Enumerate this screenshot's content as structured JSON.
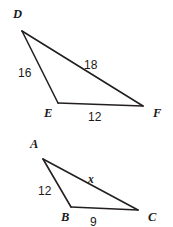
{
  "figure": {
    "background_color": "#ffffff",
    "stroke_color": "#231f20",
    "text_color": "#1a1a1a",
    "width": 173,
    "height": 227
  },
  "triangles": [
    {
      "id": "triangle-def",
      "name": "DEF",
      "vertices": [
        {
          "label": "D",
          "x": 22,
          "y": 31,
          "label_x": 13,
          "label_y": 18
        },
        {
          "label": "E",
          "x": 58,
          "y": 103,
          "label_x": 44,
          "label_y": 117
        },
        {
          "label": "F",
          "x": 143,
          "y": 106,
          "label_x": 153,
          "label_y": 117
        }
      ],
      "sides": [
        {
          "from": "D",
          "to": "E",
          "length": "16",
          "label_x": 18,
          "label_y": 77,
          "style": "number"
        },
        {
          "from": "D",
          "to": "F",
          "length": "18",
          "label_x": 84,
          "label_y": 69,
          "style": "number"
        },
        {
          "from": "E",
          "to": "F",
          "length": "12",
          "label_x": 88,
          "label_y": 121,
          "style": "number"
        }
      ]
    },
    {
      "id": "triangle-abc",
      "name": "ABC",
      "vertices": [
        {
          "label": "A",
          "x": 43,
          "y": 159,
          "label_x": 30,
          "label_y": 148
        },
        {
          "label": "B",
          "x": 71,
          "y": 207,
          "label_x": 61,
          "label_y": 221
        },
        {
          "label": "C",
          "x": 138,
          "y": 210,
          "label_x": 148,
          "label_y": 221
        }
      ],
      "sides": [
        {
          "from": "A",
          "to": "B",
          "length": "12",
          "label_x": 38,
          "label_y": 195,
          "style": "number"
        },
        {
          "from": "A",
          "to": "C",
          "length": "x",
          "label_x": 88,
          "label_y": 183,
          "style": "variable"
        },
        {
          "from": "B",
          "to": "C",
          "length": "9",
          "label_x": 90,
          "label_y": 226,
          "style": "number"
        }
      ]
    }
  ]
}
